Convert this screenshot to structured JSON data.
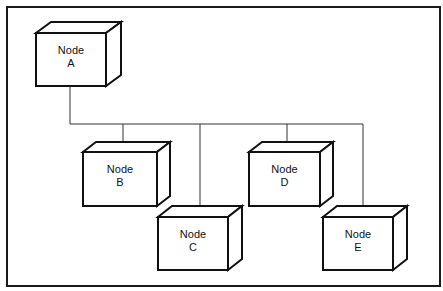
{
  "diagram": {
    "type": "network-topology",
    "root": "Node A",
    "nodes": [
      {
        "id": "A",
        "line1": "Node",
        "line2": "A",
        "fx": 36,
        "fy": 33,
        "fw": 70,
        "fh": 53,
        "dx": 15,
        "dy": 11
      },
      {
        "id": "B",
        "line1": "Node",
        "line2": "B",
        "fx": 83,
        "fy": 152,
        "fw": 74,
        "fh": 54,
        "dx": 13,
        "dy": 10
      },
      {
        "id": "C",
        "line1": "Node",
        "line2": "C",
        "fx": 158,
        "fy": 217,
        "fw": 70,
        "fh": 53,
        "dx": 14,
        "dy": 11
      },
      {
        "id": "D",
        "line1": "Node",
        "line2": "D",
        "fx": 249,
        "fy": 152,
        "fw": 71,
        "fh": 54,
        "dx": 13,
        "dy": 10
      },
      {
        "id": "E",
        "line1": "Node",
        "line2": "E",
        "fx": 323,
        "fy": 217,
        "fw": 70,
        "fh": 53,
        "dx": 14,
        "dy": 11
      }
    ],
    "connections": [
      {
        "from": "A",
        "to": "B"
      },
      {
        "from": "A",
        "to": "C"
      },
      {
        "from": "A",
        "to": "D"
      },
      {
        "from": "A",
        "to": "E"
      }
    ],
    "bus": {
      "y": 124,
      "x_start": 70,
      "x_end": 363,
      "drops": [
        123,
        200,
        287,
        363
      ]
    },
    "colors": {
      "stroke": "#111111",
      "background": "#ffffff"
    }
  }
}
